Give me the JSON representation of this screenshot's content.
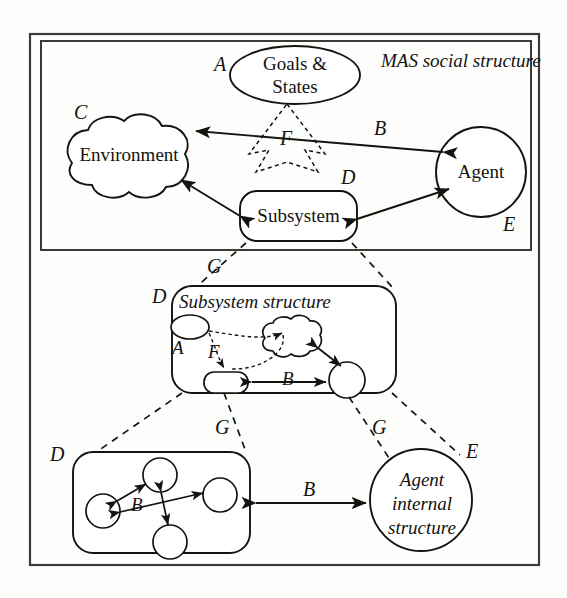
{
  "figure": {
    "title_text": "MAS social structure",
    "background_color": "#fdfdfc",
    "stroke_color": "#15130f"
  },
  "panels": {
    "mas_social": {
      "caption": "MAS social structure",
      "nodes": {
        "goals_states": {
          "label": "Goals &\nStates",
          "tag": "A",
          "shape": "ellipse"
        },
        "environment": {
          "label": "Environment",
          "tag": "C",
          "shape": "cloud"
        },
        "agent": {
          "label": "Agent",
          "tag": "E",
          "shape": "circle"
        },
        "subsystem": {
          "label": "Subsystem",
          "tag": "D",
          "shape": "rounded-rect"
        }
      },
      "edge_tags": {
        "agent_environment": "B",
        "goals_broadcast": "F"
      }
    },
    "subsystem_structure": {
      "caption": "Subsystem structure",
      "tag": "D",
      "node_tags": {
        "goal_ellipse": "A"
      },
      "edge_tags": {
        "broadcast": "F",
        "interaction": "B"
      }
    },
    "agent_internal": {
      "caption": "Agent\ninternal\nstructure",
      "tag": "E"
    },
    "agent_internal_graph": {
      "tag": "D",
      "edge_tag": "B"
    },
    "cross_level_edge_tag": "B"
  },
  "refinement_tags": {
    "subsystem_to_structure": "G",
    "structure_to_graph": "G",
    "structure_to_agent": "G"
  }
}
